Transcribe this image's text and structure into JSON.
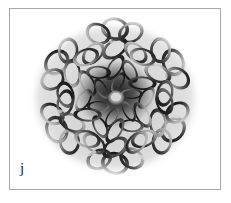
{
  "figure": {
    "panel_label": "j",
    "alt_description": "grayscale photograph of interlinked metal jump rings woven into a six-fold rosette chainmail cluster on a white background",
    "frame_color": "#a8a8a8",
    "background_color": "#ffffff",
    "label_color": "#1a1a1a",
    "image": {
      "subject": "chainmail ring cluster",
      "palette": {
        "highlight": "#f2f2f2",
        "light_metal": "#c9c9c9",
        "mid_metal": "#8a8a8a",
        "dark_metal": "#3d3d3d",
        "shadow": "#141414",
        "core_shadow": "#070707",
        "backdrop": "#ffffff"
      },
      "symmetry_fold": 6,
      "center": {
        "x": 113,
        "y": 94
      },
      "radius": 82
    }
  }
}
